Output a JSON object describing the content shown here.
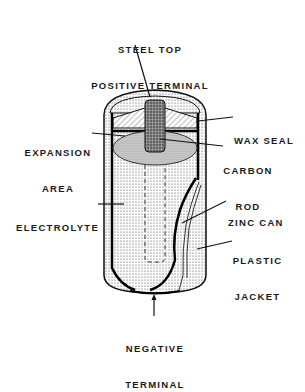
{
  "diagram": {
    "labels": {
      "top": [
        "STEEL TOP",
        "POSITIVE TERMINAL"
      ],
      "wax_seal": [
        "WAX SEAL"
      ],
      "expansion_area": [
        "EXPANSION",
        "AREA"
      ],
      "carbon_rod": [
        "CARBON",
        "ROD"
      ],
      "electrolyte": [
        "ELECTROLYTE"
      ],
      "zinc_can": [
        "ZINC CAN"
      ],
      "plastic_jacket": [
        "PLASTIC",
        "JACKET"
      ],
      "negative_terminal": [
        "NEGATIVE",
        "TERMINAL"
      ]
    }
  }
}
